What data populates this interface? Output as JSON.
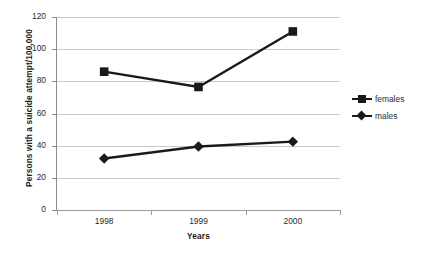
{
  "chart_data": {
    "type": "line",
    "title": "",
    "xlabel": "Years",
    "ylabel": "Persons with a suicide attempt/100,000",
    "categories": [
      "1998",
      "1999",
      "2000"
    ],
    "x_tick_labels": [
      "1998",
      "1999",
      "2000"
    ],
    "y_tick_labels": [
      "0",
      "20",
      "40",
      "60",
      "80",
      "100",
      "120"
    ],
    "y_ticks": [
      0,
      20,
      40,
      60,
      80,
      100,
      120
    ],
    "ylim": [
      0,
      120
    ],
    "grid": "horizontal",
    "legend_position": "right",
    "series": [
      {
        "name": "females",
        "marker": "square",
        "color": "#1a1a1a",
        "values": [
          86,
          76.5,
          111
        ]
      },
      {
        "name": "males",
        "marker": "diamond",
        "color": "#1a1a1a",
        "values": [
          32,
          39.5,
          42.5
        ]
      }
    ]
  },
  "legend": {
    "items": [
      {
        "label": "females",
        "marker": "square"
      },
      {
        "label": "males",
        "marker": "diamond"
      }
    ]
  },
  "colors": {
    "series": "#1a1a1a",
    "gridline": "#c9c9c9",
    "axis": "#8c8c8c",
    "background": "#ffffff",
    "text": "#2b2b2b"
  }
}
